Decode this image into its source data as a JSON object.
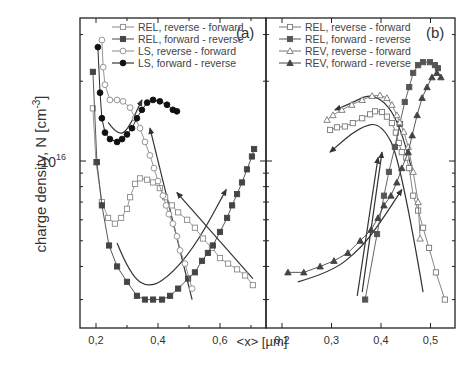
{
  "chart_data": [
    {
      "panel": "(a)",
      "type": "scatter",
      "xlabel": "<x> [µm]",
      "ylabel": "charge density, N [cm^-3]",
      "y_scale": "log",
      "y_unit": "1e16 cm^-3",
      "xlim": [
        0.15,
        0.75
      ],
      "ylim": [
        0.23,
        3.2
      ],
      "x_ticks": [
        "0,2",
        "0,4",
        "0,6"
      ],
      "x_tick_values": [
        0.2,
        0.4,
        0.6
      ],
      "y_tick_label": "10",
      "y_tick_exp": "16",
      "legend_position": "top-right",
      "series": [
        {
          "name": "REL, reverse - forward",
          "marker": "open-square",
          "color": "#8a8a8a",
          "points": [
            [
              0.19,
              1.58
            ],
            [
              0.2,
              0.99
            ],
            [
              0.219,
              0.7
            ],
            [
              0.239,
              0.61
            ],
            [
              0.261,
              0.58
            ],
            [
              0.281,
              0.61
            ],
            [
              0.3,
              0.66
            ],
            [
              0.31,
              0.73
            ],
            [
              0.326,
              0.82
            ],
            [
              0.342,
              0.86
            ],
            [
              0.365,
              0.85
            ],
            [
              0.384,
              0.83
            ],
            [
              0.406,
              0.79
            ],
            [
              0.423,
              0.73
            ],
            [
              0.445,
              0.68
            ],
            [
              0.465,
              0.64
            ],
            [
              0.494,
              0.6
            ],
            [
              0.519,
              0.56
            ],
            [
              0.545,
              0.51
            ],
            [
              0.574,
              0.47
            ],
            [
              0.6,
              0.43
            ],
            [
              0.626,
              0.41
            ],
            [
              0.655,
              0.39
            ],
            [
              0.681,
              0.37
            ],
            [
              0.706,
              0.34
            ]
          ]
        },
        {
          "name": "REL, forward - reverse",
          "marker": "filled-square",
          "color": "#444444",
          "points": [
            [
              0.19,
              2.17
            ],
            [
              0.203,
              0.99
            ],
            [
              0.219,
              0.68
            ],
            [
              0.242,
              0.48
            ],
            [
              0.268,
              0.4
            ],
            [
              0.3,
              0.35
            ],
            [
              0.332,
              0.31
            ],
            [
              0.358,
              0.3
            ],
            [
              0.384,
              0.3
            ],
            [
              0.413,
              0.3
            ],
            [
              0.439,
              0.31
            ],
            [
              0.465,
              0.33
            ],
            [
              0.497,
              0.36
            ],
            [
              0.519,
              0.38
            ],
            [
              0.542,
              0.42
            ],
            [
              0.561,
              0.45
            ],
            [
              0.577,
              0.48
            ],
            [
              0.6,
              0.54
            ],
            [
              0.623,
              0.61
            ],
            [
              0.639,
              0.68
            ],
            [
              0.655,
              0.75
            ],
            [
              0.671,
              0.83
            ],
            [
              0.687,
              0.93
            ],
            [
              0.703,
              1.04
            ],
            [
              0.71,
              1.11
            ]
          ]
        },
        {
          "name": "LS, reverse - forward",
          "marker": "open-circle",
          "color": "#8a8a8a",
          "points": [
            [
              0.219,
              2.86
            ],
            [
              0.223,
              2.26
            ],
            [
              0.229,
              1.94
            ],
            [
              0.245,
              1.7
            ],
            [
              0.268,
              1.7
            ],
            [
              0.287,
              1.68
            ],
            [
              0.31,
              1.59
            ],
            [
              0.326,
              1.45
            ],
            [
              0.342,
              1.33
            ],
            [
              0.358,
              1.18
            ],
            [
              0.374,
              1.05
            ],
            [
              0.387,
              0.94
            ],
            [
              0.4,
              0.84
            ],
            [
              0.416,
              0.74
            ],
            [
              0.426,
              0.68
            ],
            [
              0.435,
              0.63
            ],
            [
              0.448,
              0.58
            ],
            [
              0.461,
              0.52
            ],
            [
              0.471,
              0.46
            ],
            [
              0.487,
              0.41
            ],
            [
              0.51,
              0.33
            ]
          ]
        },
        {
          "name": "LS, forward - reverse",
          "marker": "filled-circle",
          "color": "#111111",
          "points": [
            [
              0.206,
              2.69
            ],
            [
              0.213,
              1.81
            ],
            [
              0.219,
              1.45
            ],
            [
              0.229,
              1.28
            ],
            [
              0.245,
              1.21
            ],
            [
              0.268,
              1.18
            ],
            [
              0.284,
              1.21
            ],
            [
              0.3,
              1.26
            ],
            [
              0.316,
              1.33
            ],
            [
              0.332,
              1.45
            ],
            [
              0.348,
              1.56
            ],
            [
              0.365,
              1.66
            ],
            [
              0.384,
              1.7
            ],
            [
              0.406,
              1.68
            ],
            [
              0.429,
              1.63
            ],
            [
              0.448,
              1.56
            ],
            [
              0.461,
              1.54
            ]
          ]
        }
      ],
      "arrows": [
        {
          "from": [
            0.51,
            0.3
          ],
          "to": [
            0.374,
            1.33
          ]
        },
        {
          "path": [
            [
              0.268,
              0.49
            ],
            [
              0.31,
              0.37
            ],
            [
              0.374,
              0.33
            ],
            [
              0.45,
              0.38
            ],
            [
              0.53,
              0.5
            ],
            [
              0.62,
              0.78
            ]
          ],
          "head": "end"
        },
        {
          "from": [
            0.706,
            0.36
          ],
          "to": [
            0.461,
            0.76
          ]
        },
        {
          "path": [
            [
              0.239,
              1.4
            ],
            [
              0.268,
              1.26
            ],
            [
              0.3,
              1.29
            ],
            [
              0.348,
              1.7
            ]
          ],
          "head": "end"
        }
      ]
    },
    {
      "panel": "(b)",
      "type": "scatter",
      "xlabel": "<x> [µm]",
      "y_scale": "log",
      "y_unit": "1e16 cm^-3",
      "xlim": [
        0.17,
        0.55
      ],
      "ylim": [
        0.23,
        3.2
      ],
      "x_ticks": [
        "0,2",
        "0,3",
        "0,4",
        "0,5"
      ],
      "x_tick_values": [
        0.2,
        0.3,
        0.4,
        0.5
      ],
      "legend_position": "top-left",
      "series": [
        {
          "name": "REL, reverse - forward",
          "marker": "open-square",
          "color": "#777777",
          "points": [
            [
              0.297,
              1.31
            ],
            [
              0.311,
              1.34
            ],
            [
              0.327,
              1.35
            ],
            [
              0.343,
              1.39
            ],
            [
              0.362,
              1.45
            ],
            [
              0.378,
              1.5
            ],
            [
              0.388,
              1.54
            ],
            [
              0.402,
              1.53
            ],
            [
              0.412,
              1.47
            ],
            [
              0.422,
              1.39
            ],
            [
              0.43,
              1.28
            ],
            [
              0.436,
              1.17
            ],
            [
              0.442,
              1.08
            ],
            [
              0.451,
              1.03
            ],
            [
              0.457,
              0.94
            ],
            [
              0.465,
              0.74
            ],
            [
              0.475,
              0.65
            ],
            [
              0.485,
              0.56
            ],
            [
              0.497,
              0.47
            ],
            [
              0.511,
              0.38
            ],
            [
              0.529,
              0.3
            ]
          ]
        },
        {
          "name": "REL, forward - reverse",
          "marker": "filled-square",
          "color": "#555555",
          "points": [
            [
              0.368,
              0.3
            ],
            [
              0.392,
              0.53
            ],
            [
              0.406,
              0.74
            ],
            [
              0.416,
              0.91
            ],
            [
              0.428,
              1.13
            ],
            [
              0.438,
              1.38
            ],
            [
              0.448,
              1.67
            ],
            [
              0.457,
              1.9
            ],
            [
              0.465,
              2.15
            ],
            [
              0.475,
              2.3
            ],
            [
              0.485,
              2.36
            ],
            [
              0.499,
              2.36
            ],
            [
              0.509,
              2.3
            ],
            [
              0.515,
              2.24
            ]
          ]
        },
        {
          "name": "REV, reverse - forward",
          "marker": "open-triangle",
          "color": "#777777",
          "points": [
            [
              0.291,
              1.43
            ],
            [
              0.303,
              1.49
            ],
            [
              0.321,
              1.56
            ],
            [
              0.341,
              1.63
            ],
            [
              0.362,
              1.7
            ],
            [
              0.382,
              1.76
            ],
            [
              0.398,
              1.77
            ],
            [
              0.412,
              1.73
            ],
            [
              0.422,
              1.63
            ],
            [
              0.432,
              1.49
            ],
            [
              0.438,
              1.4
            ],
            [
              0.446,
              1.29
            ],
            [
              0.455,
              1.13
            ],
            [
              0.465,
              0.91
            ],
            [
              0.475,
              0.7
            ],
            [
              0.479,
              0.51
            ]
          ]
        },
        {
          "name": "REV, forward - reverse",
          "marker": "filled-triangle",
          "color": "#444444",
          "points": [
            [
              0.212,
              0.38
            ],
            [
              0.244,
              0.38
            ],
            [
              0.277,
              0.4
            ],
            [
              0.305,
              0.42
            ],
            [
              0.333,
              0.45
            ],
            [
              0.358,
              0.5
            ],
            [
              0.38,
              0.55
            ],
            [
              0.394,
              0.61
            ],
            [
              0.406,
              0.68
            ],
            [
              0.42,
              0.74
            ],
            [
              0.432,
              0.83
            ],
            [
              0.442,
              0.94
            ],
            [
              0.455,
              1.08
            ],
            [
              0.463,
              1.25
            ],
            [
              0.473,
              1.49
            ],
            [
              0.483,
              1.73
            ],
            [
              0.493,
              1.9
            ],
            [
              0.503,
              2.07
            ],
            [
              0.513,
              2.15
            ],
            [
              0.521,
              2.07
            ]
          ]
        }
      ],
      "arrows": [
        {
          "path": [
            [
              0.463,
              0.91
            ],
            [
              0.44,
              1.4
            ],
            [
              0.388,
              1.83
            ],
            [
              0.333,
              1.63
            ],
            [
              0.307,
              1.56
            ]
          ],
          "head": "end"
        },
        {
          "path": [
            [
              0.485,
              0.32
            ],
            [
              0.44,
              1.0
            ],
            [
              0.4,
              1.4
            ],
            [
              0.355,
              1.34
            ],
            [
              0.297,
              1.08
            ]
          ],
          "head": "end"
        },
        {
          "from": [
            0.362,
            0.32
          ],
          "to": [
            0.402,
            1.08
          ]
        },
        {
          "from": [
            0.352,
            0.31
          ],
          "to": [
            0.394,
            1.03
          ]
        },
        {
          "path": [
            [
              0.232,
              0.35
            ],
            [
              0.3,
              0.38
            ],
            [
              0.36,
              0.47
            ],
            [
              0.4,
              0.59
            ],
            [
              0.442,
              0.78
            ]
          ],
          "head": "end"
        }
      ]
    }
  ]
}
